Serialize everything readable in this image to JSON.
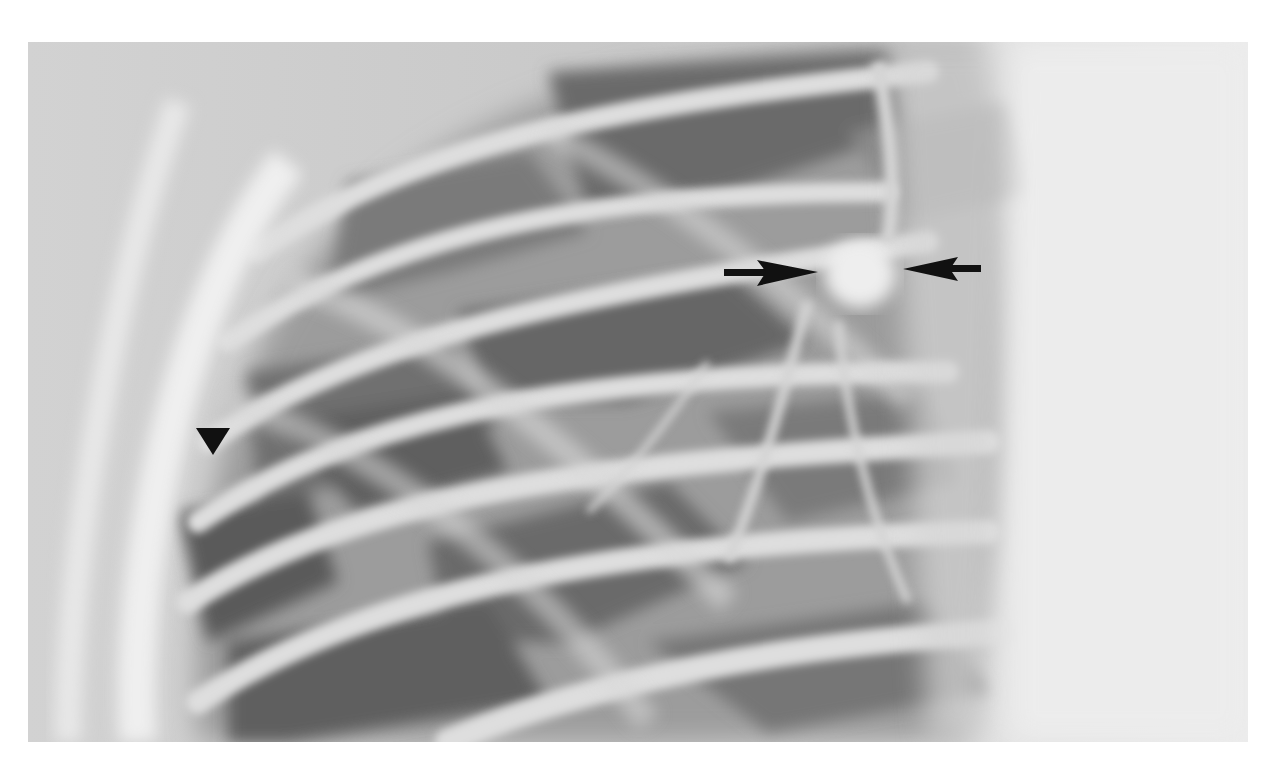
{
  "image": {
    "type": "radiograph",
    "description": "Grayscale chest radiograph (lateral lung field) showing ribs and intercostal spaces with a rounded nodular opacity near the hilum",
    "palette": {
      "background": "#ffffff",
      "bone": "#e4e4e4",
      "soft_tissue": "#cfcfcf",
      "lung": "#8a8a8a",
      "lung_dark": "#5e5e5e",
      "annotation": "#111111"
    }
  },
  "annotations": [
    {
      "kind": "arrow",
      "direction": "right",
      "label": "arrow-right",
      "x1": 725,
      "y1": 272,
      "x2": 818,
      "y2": 272
    },
    {
      "kind": "arrow",
      "direction": "left",
      "label": "arrow-left",
      "x1": 980,
      "y1": 268,
      "x2": 903,
      "y2": 270
    },
    {
      "kind": "arrowhead",
      "direction": "down",
      "label": "arrowhead-down",
      "x": 213,
      "y": 441
    }
  ]
}
